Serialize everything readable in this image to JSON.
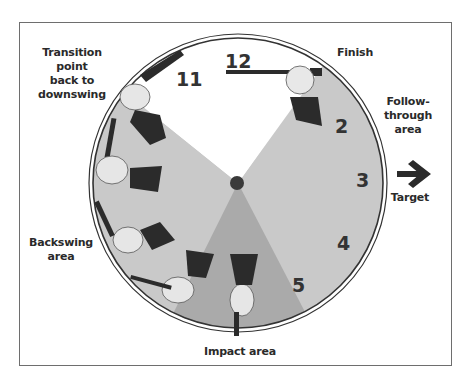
{
  "figure": {
    "labels": {
      "transition": "Transition point back to downswing",
      "transition_lines": [
        "Transition point",
        "back to",
        "downswing"
      ],
      "finish": "Finish",
      "follow_through_lines": [
        "Follow-",
        "through",
        "area"
      ],
      "target": "Target",
      "backswing_lines": [
        "Backswing",
        "area"
      ],
      "impact": "Impact area"
    },
    "clock_numbers": [
      "12",
      "11",
      "2",
      "3",
      "4",
      "5"
    ],
    "icons": {
      "target_arrow": "right-arrow-icon"
    },
    "colors": {
      "light_wedge": "#c8c8c8",
      "dark_wedge": "#a9a9a9",
      "white_wedge": "#ffffff",
      "ink": "#333333"
    },
    "zones": [
      {
        "name": "Finish / transition (white)",
        "from_clock": "10",
        "to_clock": "1"
      },
      {
        "name": "Follow-through area",
        "from_clock": "1",
        "to_clock": "5"
      },
      {
        "name": "Impact area",
        "from_clock": "5",
        "to_clock": "7"
      },
      {
        "name": "Backswing area",
        "from_clock": "7",
        "to_clock": "10"
      }
    ]
  }
}
